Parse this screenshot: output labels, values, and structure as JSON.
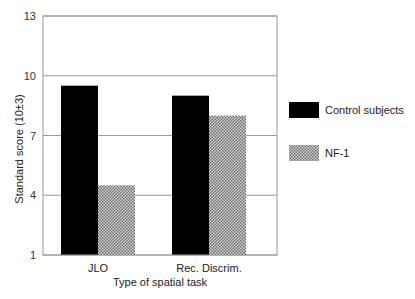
{
  "chart_data": {
    "type": "bar",
    "title": "",
    "xlabel": "Type of spatial task",
    "ylabel": "Standard score (10±3)",
    "ylim": [
      1,
      13
    ],
    "yticks": [
      1,
      4,
      7,
      10,
      13
    ],
    "grid": true,
    "legend_position": "right",
    "categories": [
      "JLO",
      "Rec. Discrim."
    ],
    "series": [
      {
        "name": "Control subjects",
        "values": [
          9.5,
          9.0
        ],
        "color": "#000000",
        "pattern": "solid"
      },
      {
        "name": "NF-1",
        "values": [
          4.5,
          8.0
        ],
        "color": "#aaaaaa",
        "pattern": "checker"
      }
    ]
  }
}
